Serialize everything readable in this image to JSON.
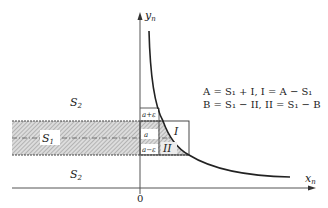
{
  "axes": {
    "x_label": "x",
    "x_sub": "n",
    "y_label": "y",
    "y_sub": "n",
    "origin_label": "0"
  },
  "regions": {
    "s2_top": {
      "base": "S",
      "sub": "2"
    },
    "s1": {
      "base": "S",
      "sub": "1"
    },
    "s2_bottom": {
      "base": "S",
      "sub": "2"
    },
    "region_I": "I",
    "region_II": "II"
  },
  "levels": {
    "upper": "a+ε",
    "middle": "a",
    "lower": "a−ε"
  },
  "equations": {
    "line1": "A = S₁ + I, I = A − S₁",
    "line2": "B = S₁ − II, II = S₁ − B"
  },
  "colors": {
    "ink": "#222222",
    "axis": "#555555",
    "hatch": "#9a9a9a",
    "band_fill": "#d9d9d9"
  }
}
